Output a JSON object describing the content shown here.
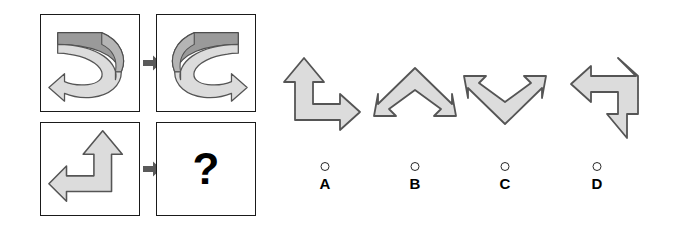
{
  "puzzle": {
    "type": "visual-analogy-matrix",
    "question_symbol": "?",
    "matrix": {
      "rows": [
        {
          "name": "example-row",
          "source": {
            "name": "curved-ribbon-arrow-left",
            "description": "3D curved ribbon arrow, dark top band curving right then arrowhead pointing down-left",
            "arrow_direction": "counterclockwise-to-left"
          },
          "relation_icon": "right-arrow-icon",
          "target": {
            "name": "curved-ribbon-arrow-right",
            "description": "3D curved ribbon arrow mirrored, dark top band curving left then arrowhead pointing down-right",
            "arrow_direction": "clockwise-to-right"
          }
        },
        {
          "name": "question-row",
          "source": {
            "name": "l-arrow-up-left",
            "description": "L-shaped double-headed arrow pointing up and left",
            "arrow_direction": "up-left"
          },
          "relation_icon": "right-arrow-icon",
          "target": {
            "name": "unknown-answer-cell",
            "description": "empty cell containing a question mark",
            "arrow_direction": "unknown"
          }
        }
      ]
    },
    "options": [
      {
        "id": "A",
        "label": "A",
        "glyph_name": "l-arrow-up-right",
        "description": "L-shaped double-headed arrow pointing up and right",
        "selected": false
      },
      {
        "id": "B",
        "label": "B",
        "glyph_name": "chevron-arrow-down-left-down-right",
        "description": "Tent/chevron shaped double-headed arrow pointing down-left and down-right",
        "selected": false
      },
      {
        "id": "C",
        "label": "C",
        "glyph_name": "vee-arrow-up-left-up-right",
        "description": "V shaped double-headed arrow pointing up-left and up-right",
        "selected": false
      },
      {
        "id": "D",
        "label": "D",
        "glyph_name": "l-arrow-left-down",
        "description": "L-shaped double-headed arrow pointing left and down",
        "selected": false
      }
    ]
  },
  "colors": {
    "shape_fill": "#dcdcdc",
    "shape_stroke": "#555555",
    "ribbon_dark_fill": "#9a9a9a",
    "ribbon_light_fill": "#dcdcdc",
    "panel_border": "#1a1a1a",
    "connector_fill": "#5a5a5a",
    "text": "#000000",
    "background": "#ffffff"
  }
}
